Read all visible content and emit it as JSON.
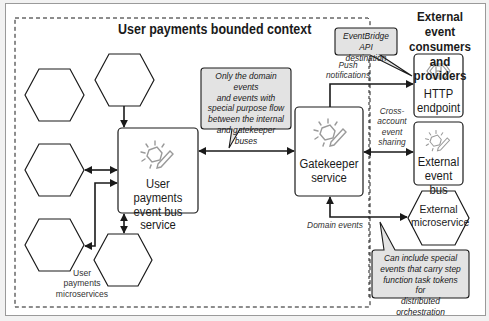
{
  "diagram": {
    "bounded_context": {
      "title": "User payments bounded context",
      "microservices_label": "User payments microservices",
      "microservices_label_lines": [
        "User",
        "payments",
        "microservices"
      ],
      "microservice_count": 5
    },
    "external": {
      "title_lines": [
        "External event",
        "consumers and",
        "providers"
      ]
    },
    "nodes": {
      "event_bus": {
        "label_lines": [
          "User payments",
          "event bus service"
        ],
        "icon": "eventbridge-icon"
      },
      "gatekeeper": {
        "label_lines": [
          "Gatekeeper",
          "service"
        ],
        "icon": "eventbridge-icon"
      },
      "http_endpoint": {
        "label_lines": [
          "HTTP",
          "endpoint"
        ],
        "icon": "http-endpoint-icon"
      },
      "external_bus": {
        "label_lines": [
          "External",
          "event bus"
        ],
        "icon": "eventbridge-icon"
      },
      "external_microservice": {
        "label_lines": [
          "External",
          "microservice"
        ]
      }
    },
    "callouts": {
      "internal_flow": [
        "Only the domain events",
        "and events with",
        "special purpose flow",
        "between the internal",
        "and gatekeeper buses"
      ],
      "api_destination": [
        "EventBridge",
        "API destination"
      ],
      "task_tokens": [
        "Can include special",
        "events that carry step",
        "function task tokens for",
        "distributed orchestration"
      ]
    },
    "edge_labels": {
      "push": [
        "Push",
        "notifications"
      ],
      "cross_account": [
        "Cross-",
        "account",
        "event",
        "sharing"
      ],
      "domain_events": "Domain events"
    },
    "colors": {
      "stroke": "#1a1a1a",
      "callout_fill": "#e3e3e3",
      "icon": "#9a9a9a",
      "background": "#ffffff"
    }
  }
}
